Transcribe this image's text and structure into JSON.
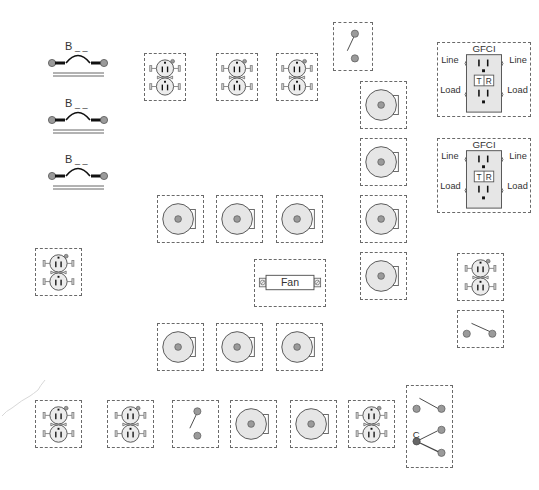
{
  "diagram": {
    "title": "",
    "colors": {
      "border": "#6a6a6a",
      "fill": "#e6e6e6",
      "stroke": "#555555",
      "terminal": "#9a9a9a",
      "common_terminal": "#666666"
    },
    "breakers": [
      {
        "label": "B",
        "suffix": "_ _",
        "x": 48,
        "y": 40
      },
      {
        "label": "B",
        "suffix": "_ _",
        "x": 48,
        "y": 97
      },
      {
        "label": "B",
        "suffix": "_ _",
        "x": 48,
        "y": 153
      }
    ],
    "receptacles": [
      {
        "id": "rec-1",
        "x": 144,
        "y": 53,
        "w": 42,
        "h": 48
      },
      {
        "id": "rec-2",
        "x": 216,
        "y": 53,
        "w": 42,
        "h": 48
      },
      {
        "id": "rec-3",
        "x": 276,
        "y": 53,
        "w": 42,
        "h": 48
      },
      {
        "id": "rec-4",
        "x": 35,
        "y": 248,
        "w": 47,
        "h": 48
      },
      {
        "id": "rec-5",
        "x": 457,
        "y": 253,
        "w": 47,
        "h": 48
      },
      {
        "id": "rec-6",
        "x": 35,
        "y": 400,
        "w": 47,
        "h": 48
      },
      {
        "id": "rec-7",
        "x": 107,
        "y": 400,
        "w": 47,
        "h": 48
      },
      {
        "id": "rec-8",
        "x": 348,
        "y": 400,
        "w": 47,
        "h": 48
      }
    ],
    "gfci": [
      {
        "title": "GFCI",
        "line_left": "Line",
        "line_right": "Line",
        "load_left": "Load",
        "load_right": "Load",
        "test": "T",
        "reset": "R",
        "x": 437,
        "y": 42,
        "w": 94,
        "h": 75
      },
      {
        "title": "GFCI",
        "line_left": "Line",
        "line_right": "Line",
        "load_left": "Load",
        "load_right": "Load",
        "test": "T",
        "reset": "R",
        "x": 437,
        "y": 138,
        "w": 94,
        "h": 75
      }
    ],
    "lights": [
      {
        "id": "light-1",
        "x": 360,
        "y": 81,
        "w": 47,
        "h": 48
      },
      {
        "id": "light-2",
        "x": 360,
        "y": 138,
        "w": 47,
        "h": 48
      },
      {
        "id": "light-3",
        "x": 360,
        "y": 195,
        "w": 47,
        "h": 48
      },
      {
        "id": "light-4",
        "x": 360,
        "y": 252,
        "w": 47,
        "h": 48
      },
      {
        "id": "light-5",
        "x": 157,
        "y": 195,
        "w": 47,
        "h": 48
      },
      {
        "id": "light-6",
        "x": 216,
        "y": 195,
        "w": 47,
        "h": 48
      },
      {
        "id": "light-7",
        "x": 276,
        "y": 195,
        "w": 47,
        "h": 48
      },
      {
        "id": "light-8",
        "x": 157,
        "y": 323,
        "w": 47,
        "h": 48
      },
      {
        "id": "light-9",
        "x": 216,
        "y": 323,
        "w": 47,
        "h": 48
      },
      {
        "id": "light-10",
        "x": 276,
        "y": 323,
        "w": 47,
        "h": 48
      },
      {
        "id": "light-11",
        "x": 230,
        "y": 400,
        "w": 47,
        "h": 48
      },
      {
        "id": "light-12",
        "x": 290,
        "y": 400,
        "w": 47,
        "h": 48
      }
    ],
    "fan": {
      "label": "Fan",
      "x": 254,
      "y": 259,
      "w": 72,
      "h": 48
    },
    "switches": [
      {
        "id": "switch-single-1",
        "type": "single-pole",
        "orientation": "vertical",
        "x": 333,
        "y": 22,
        "w": 40,
        "h": 49
      },
      {
        "id": "switch-single-2",
        "type": "single-pole",
        "orientation": "vertical",
        "x": 172,
        "y": 400,
        "w": 47,
        "h": 48
      },
      {
        "id": "switch-single-3",
        "type": "single-pole",
        "orientation": "horizontal",
        "x": 457,
        "y": 310,
        "w": 47,
        "h": 38
      }
    ],
    "three_way": {
      "common_label": "C",
      "x": 406,
      "y": 385,
      "w": 47,
      "h": 83
    }
  }
}
